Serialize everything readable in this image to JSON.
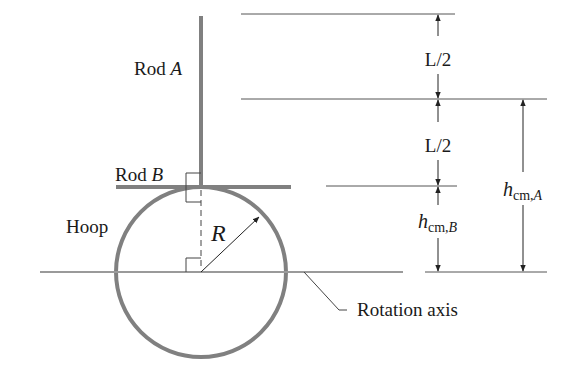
{
  "diagram": {
    "labels": {
      "rod_a": "Rod ",
      "rod_a_var": "A",
      "rod_b": "Rod ",
      "rod_b_var": "B",
      "hoop": "Hoop",
      "radius": "R",
      "rotation_axis": "Rotation axis",
      "half_length_top": "L/2",
      "half_length_bottom": "L/2",
      "h_cm_b_main": "h",
      "h_cm_b_sub": "cm,",
      "h_cm_b_var": "B",
      "h_cm_a_main": "h",
      "h_cm_a_sub": "cm,",
      "h_cm_a_var": "A"
    },
    "colors": {
      "structure": "#808080",
      "lines": "#555555",
      "text": "#1a1a1a"
    }
  }
}
